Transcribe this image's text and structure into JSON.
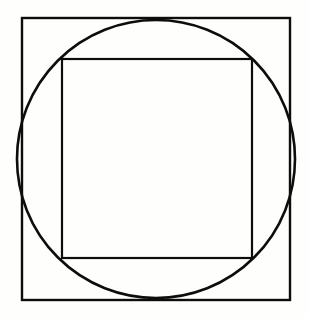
{
  "figure": {
    "canvas": {
      "width": 309,
      "height": 318,
      "background_color": "#fefefd"
    },
    "stroke_color": "#0d0d0d",
    "shapes": {
      "outer_square": {
        "name": "outer-square",
        "label": "Outer square",
        "x": 22,
        "y": 18,
        "width": 268,
        "height": 282,
        "stroke_width": 2.4
      },
      "circle": {
        "name": "circle",
        "label": "Circle inscribed in outer square",
        "cx": 156,
        "cy": 159,
        "r": 139,
        "stroke_width": 2.6
      },
      "inner_square": {
        "name": "inner-square",
        "label": "Inner square inscribed in circle",
        "x": 62,
        "y": 59,
        "width": 190,
        "height": 199,
        "stroke_width": 2.2
      }
    }
  }
}
